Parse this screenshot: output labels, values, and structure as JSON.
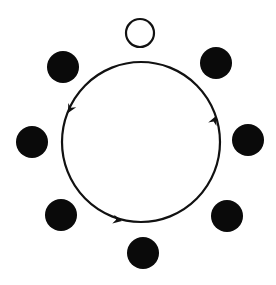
{
  "diagram": {
    "width": 276,
    "height": 285,
    "background": "#ffffff",
    "stroke_color": "#111111",
    "fill_color": "#0a0a0a",
    "loop": {
      "cx": 141,
      "cy": 142,
      "rx": 79,
      "ry": 80,
      "stroke_width": 2.2,
      "direction": "counterclockwise",
      "arrows": [
        {
          "name": "arrow-left",
          "x": 68,
          "y": 113,
          "angle": 118
        },
        {
          "name": "arrow-bottom",
          "x": 122,
          "y": 221,
          "angle": 12
        },
        {
          "name": "arrow-right",
          "x": 216,
          "y": 116,
          "angle": -66
        }
      ]
    },
    "nodes": [
      {
        "name": "node-top-open",
        "cx": 140,
        "cy": 33,
        "r": 14,
        "filled": false
      },
      {
        "name": "node-top-right",
        "cx": 216,
        "cy": 63,
        "r": 16,
        "filled": true
      },
      {
        "name": "node-right",
        "cx": 248,
        "cy": 140,
        "r": 16,
        "filled": true
      },
      {
        "name": "node-bottom-right",
        "cx": 227,
        "cy": 216,
        "r": 16,
        "filled": true
      },
      {
        "name": "node-bottom",
        "cx": 143,
        "cy": 253,
        "r": 16,
        "filled": true
      },
      {
        "name": "node-bottom-left",
        "cx": 61,
        "cy": 215,
        "r": 16,
        "filled": true
      },
      {
        "name": "node-left",
        "cx": 32,
        "cy": 142,
        "r": 16,
        "filled": true
      },
      {
        "name": "node-top-left",
        "cx": 63,
        "cy": 67,
        "r": 16,
        "filled": true
      }
    ]
  }
}
